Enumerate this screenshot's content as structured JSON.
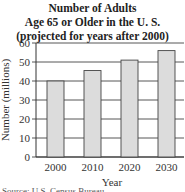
{
  "chart_data": {
    "type": "bar",
    "title": "Number of Adults Age 65 or Older in the U. S. (projected for years after 2000)",
    "title_lines": [
      "Number of Adults",
      "Age 65 or Older in the U. S.",
      "(projected for years after 2000)"
    ],
    "categories": [
      "2000",
      "2010",
      "2020",
      "2030"
    ],
    "values": [
      40,
      45.5,
      51,
      56
    ],
    "xlabel": "Year",
    "ylabel": "Number (millions)",
    "ylim": [
      0,
      60
    ],
    "yticks": [
      0,
      10,
      20,
      30,
      40,
      50,
      60
    ],
    "grid": true,
    "bar_color": "#dcdcdc",
    "legend": null
  },
  "source": "Source: U.S. Census Bureau"
}
